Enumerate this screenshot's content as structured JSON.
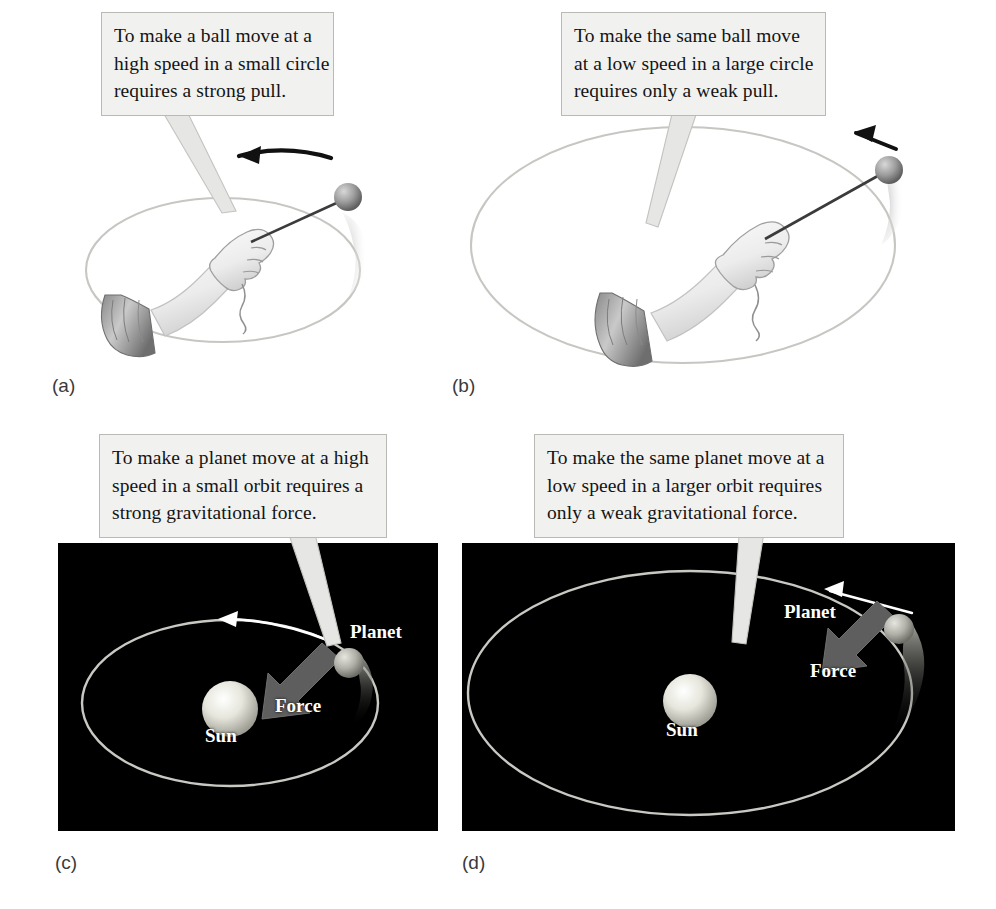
{
  "figure": {
    "background_color": "#ffffff"
  },
  "colors": {
    "callout_fill": "#f1f1ef",
    "callout_border": "#b9b9b5",
    "space_background": "#000000",
    "orbit_line": "#c9c9c4",
    "force_arrow": "#5e5e5e",
    "ball_gray": "#9a9a9a",
    "sun_glow": "#e8e8e0",
    "text_dark": "#141414",
    "text_light": "#ffffff"
  },
  "callouts": [
    {
      "id": "callout-a",
      "lines": [
        "To make a ball move at a",
        "high speed in a small circle",
        "requires a strong pull."
      ]
    },
    {
      "id": "callout-b",
      "lines": [
        "To make the same ball move",
        "at a low speed in a large circle",
        "requires only a weak pull."
      ]
    },
    {
      "id": "callout-c",
      "lines": [
        "To make a planet move at a high",
        "speed in a small orbit requires a",
        "strong gravitational force."
      ]
    },
    {
      "id": "callout-d",
      "lines": [
        "To make the same planet move at a",
        "low speed in a larger orbit requires",
        "only a weak gravitational force."
      ]
    }
  ],
  "panels": [
    {
      "id": "panel-a",
      "letter": "(a)",
      "kind": "ball-on-string",
      "description": "Hand whirling a ball on a short string in a small horizontal circle",
      "circle_size": "small",
      "speed": "high",
      "pull": "strong"
    },
    {
      "id": "panel-b",
      "letter": "(b)",
      "kind": "ball-on-string",
      "description": "Hand whirling a ball on a long string in a large horizontal circle",
      "circle_size": "large",
      "speed": "low",
      "pull": "weak"
    },
    {
      "id": "panel-c",
      "letter": "(c)",
      "kind": "orbit",
      "description": "Planet in a small orbit around the Sun with a strong inward force arrow",
      "orbit_size": "small",
      "speed": "high",
      "force": "strong",
      "labels": {
        "planet": "Planet",
        "force": "Force",
        "sun": "Sun"
      }
    },
    {
      "id": "panel-d",
      "letter": "(d)",
      "kind": "orbit",
      "description": "Planet in a large orbit around the Sun with a weak inward force arrow",
      "orbit_size": "large",
      "speed": "low",
      "force": "weak",
      "labels": {
        "planet": "Planet",
        "force": "Force",
        "sun": "Sun"
      }
    }
  ]
}
